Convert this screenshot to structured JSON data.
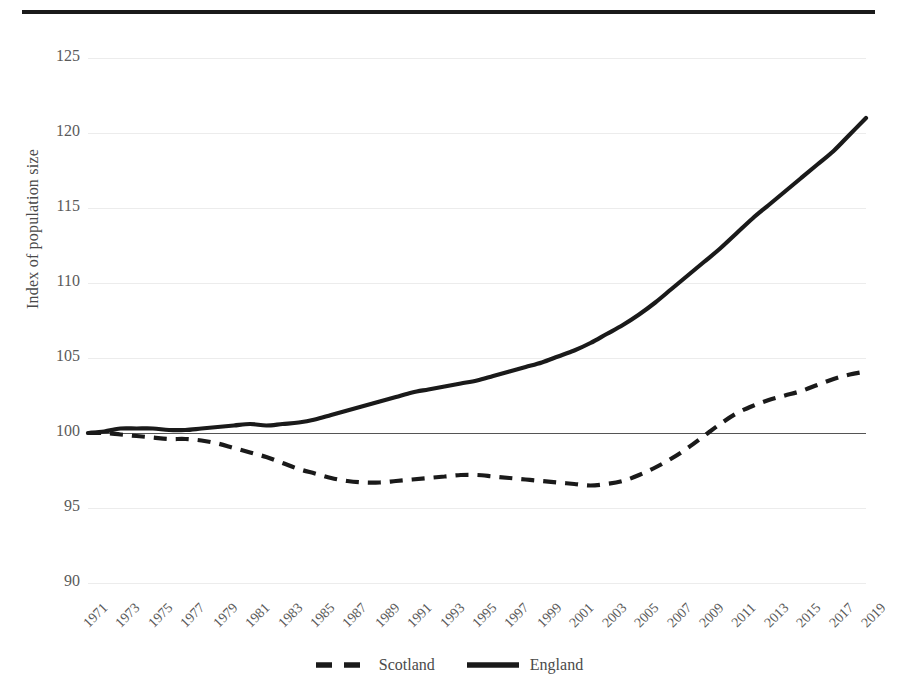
{
  "chart_data": {
    "type": "line",
    "title": "",
    "xlabel": "",
    "ylabel": "Index of population size",
    "ylim": [
      90,
      125
    ],
    "yticks": [
      90,
      95,
      100,
      105,
      110,
      115,
      120,
      125
    ],
    "xlim": [
      1971,
      2019
    ],
    "xticks": [
      1971,
      1973,
      1975,
      1977,
      1979,
      1981,
      1983,
      1985,
      1987,
      1989,
      1991,
      1993,
      1995,
      1997,
      1999,
      2001,
      2003,
      2005,
      2007,
      2009,
      2011,
      2013,
      2015,
      2017,
      2019
    ],
    "grid": true,
    "reference_line": 100,
    "legend_position": "bottom",
    "x": [
      1971,
      1972,
      1973,
      1974,
      1975,
      1976,
      1977,
      1978,
      1979,
      1980,
      1981,
      1982,
      1983,
      1984,
      1985,
      1986,
      1987,
      1988,
      1989,
      1990,
      1991,
      1992,
      1993,
      1994,
      1995,
      1996,
      1997,
      1998,
      1999,
      2000,
      2001,
      2002,
      2003,
      2004,
      2005,
      2006,
      2007,
      2008,
      2009,
      2010,
      2011,
      2012,
      2013,
      2014,
      2015,
      2016,
      2017,
      2018,
      2019
    ],
    "series": [
      {
        "name": "Scotland",
        "style": "dashed",
        "color": "#1a1a1a",
        "values": [
          100.0,
          100.0,
          99.9,
          99.8,
          99.7,
          99.6,
          99.6,
          99.5,
          99.3,
          99.0,
          98.7,
          98.4,
          98.0,
          97.6,
          97.3,
          97.0,
          96.8,
          96.7,
          96.7,
          96.8,
          96.9,
          97.0,
          97.1,
          97.2,
          97.2,
          97.1,
          97.0,
          96.9,
          96.8,
          96.7,
          96.6,
          96.5,
          96.6,
          96.8,
          97.2,
          97.7,
          98.3,
          99.0,
          99.8,
          100.6,
          101.3,
          101.8,
          102.2,
          102.5,
          102.8,
          103.2,
          103.6,
          103.9,
          104.1
        ]
      },
      {
        "name": "England",
        "style": "solid",
        "color": "#1a1a1a",
        "values": [
          100.0,
          100.1,
          100.3,
          100.3,
          100.3,
          100.2,
          100.2,
          100.3,
          100.4,
          100.5,
          100.6,
          100.5,
          100.6,
          100.7,
          100.9,
          101.2,
          101.5,
          101.8,
          102.1,
          102.4,
          102.7,
          102.9,
          103.1,
          103.3,
          103.5,
          103.8,
          104.1,
          104.4,
          104.7,
          105.1,
          105.5,
          106.0,
          106.6,
          107.2,
          107.9,
          108.7,
          109.6,
          110.5,
          111.4,
          112.3,
          113.3,
          114.3,
          115.2,
          116.1,
          117.0,
          117.9,
          118.8,
          119.9,
          121.0
        ]
      }
    ]
  },
  "legend": {
    "items": [
      {
        "label": "Scotland",
        "style": "dashed"
      },
      {
        "label": "England",
        "style": "solid"
      }
    ]
  },
  "axes": {
    "y_title": "Index of population size"
  }
}
